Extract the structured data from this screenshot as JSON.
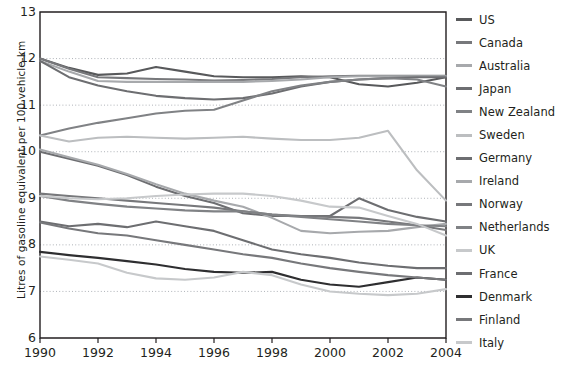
{
  "chart_data": {
    "type": "line",
    "title": "",
    "xlabel": "",
    "ylabel": "Litres of gasoline equivalent per 100 vehicle-km",
    "xlim": [
      1990,
      2004
    ],
    "ylim": [
      6,
      13
    ],
    "ytick_labels": [
      "13",
      "12",
      "11",
      "10",
      "9",
      "8",
      "7",
      "6"
    ],
    "ytick_values": [
      13,
      12,
      11,
      10,
      9,
      8,
      7,
      6
    ],
    "xtick_labels": [
      "1990",
      "1992",
      "1994",
      "1996",
      "1998",
      "2000",
      "2002",
      "2004"
    ],
    "xtick_values": [
      1990,
      1992,
      1994,
      1996,
      1998,
      2000,
      2002,
      2004
    ],
    "x": [
      1990,
      1991,
      1992,
      1993,
      1994,
      1995,
      1996,
      1997,
      1998,
      1999,
      2000,
      2001,
      2002,
      2003,
      2004
    ],
    "grid": "horizontal-dotted",
    "legend_position": "right",
    "series": [
      {
        "name": "US",
        "color": "#58595b",
        "values": [
          12.0,
          11.8,
          11.65,
          11.68,
          11.82,
          11.72,
          11.62,
          11.6,
          11.6,
          11.62,
          11.6,
          11.45,
          11.4,
          11.48,
          11.6
        ]
      },
      {
        "name": "Canada",
        "color": "#77787b",
        "values": [
          12.0,
          11.78,
          11.6,
          11.58,
          11.56,
          11.55,
          11.53,
          11.54,
          11.56,
          11.6,
          11.62,
          11.63,
          11.63,
          11.63,
          11.63
        ]
      },
      {
        "name": "Australia",
        "color": "#a7a9ac",
        "values": [
          11.95,
          11.72,
          11.52,
          11.5,
          11.5,
          11.5,
          11.5,
          11.5,
          11.52,
          11.55,
          11.6,
          11.62,
          11.62,
          11.62,
          11.62
        ]
      },
      {
        "name": "Japan",
        "color": "#6d6e71",
        "values": [
          11.95,
          11.6,
          11.42,
          11.3,
          11.2,
          11.15,
          11.12,
          11.15,
          11.25,
          11.4,
          11.5,
          11.55,
          11.58,
          11.6,
          11.6
        ]
      },
      {
        "name": "New Zealand",
        "color": "#808285",
        "values": [
          10.35,
          10.5,
          10.62,
          10.72,
          10.82,
          10.88,
          10.9,
          11.1,
          11.3,
          11.42,
          11.5,
          11.55,
          11.58,
          11.55,
          11.4
        ]
      },
      {
        "name": "Sweden",
        "color": "#bcbec0",
        "values": [
          10.35,
          10.22,
          10.3,
          10.32,
          10.3,
          10.28,
          10.3,
          10.32,
          10.28,
          10.25,
          10.25,
          10.3,
          10.45,
          9.6,
          8.95
        ]
      },
      {
        "name": "Germany",
        "color": "#6d6e71",
        "values": [
          10.0,
          9.85,
          9.7,
          9.5,
          9.25,
          9.05,
          8.9,
          8.68,
          8.62,
          8.62,
          8.62,
          9.0,
          8.75,
          8.6,
          8.5
        ]
      },
      {
        "name": "Ireland",
        "color": "#a7a9ac",
        "values": [
          10.05,
          9.88,
          9.72,
          9.52,
          9.3,
          9.1,
          8.95,
          8.82,
          8.58,
          8.3,
          8.25,
          8.28,
          8.3,
          8.38,
          8.45
        ]
      },
      {
        "name": "Norway",
        "color": "#77787b",
        "values": [
          9.1,
          9.05,
          9.0,
          8.95,
          8.9,
          8.85,
          8.8,
          8.72,
          8.65,
          8.62,
          8.6,
          8.58,
          8.5,
          8.42,
          8.32
        ]
      },
      {
        "name": "Netherlands",
        "color": "#808285",
        "values": [
          9.05,
          8.95,
          8.88,
          8.82,
          8.78,
          8.74,
          8.72,
          8.72,
          8.65,
          8.6,
          8.55,
          8.5,
          8.45,
          8.42,
          8.4
        ]
      },
      {
        "name": "UK",
        "color": "#c7c9cb",
        "values": [
          9.05,
          9.0,
          8.98,
          9.0,
          9.05,
          9.08,
          9.1,
          9.1,
          9.05,
          8.95,
          8.82,
          8.8,
          8.62,
          8.45,
          8.2
        ]
      },
      {
        "name": "France",
        "color": "#6d6e71",
        "values": [
          8.5,
          8.4,
          8.45,
          8.38,
          8.5,
          8.4,
          8.3,
          8.1,
          7.9,
          7.8,
          7.72,
          7.62,
          7.55,
          7.5,
          7.5
        ]
      },
      {
        "name": "Denmark",
        "color": "#2e2e30",
        "values": [
          7.85,
          7.78,
          7.72,
          7.65,
          7.58,
          7.48,
          7.42,
          7.4,
          7.42,
          7.25,
          7.15,
          7.1,
          7.2,
          7.3,
          7.25
        ]
      },
      {
        "name": "Finland",
        "color": "#77787b",
        "values": [
          8.48,
          8.35,
          8.25,
          8.2,
          8.1,
          8.0,
          7.9,
          7.8,
          7.72,
          7.6,
          7.5,
          7.42,
          7.35,
          7.3,
          7.25
        ]
      },
      {
        "name": "Italy",
        "color": "#c7c9cb",
        "values": [
          7.75,
          7.68,
          7.6,
          7.4,
          7.28,
          7.25,
          7.3,
          7.42,
          7.35,
          7.15,
          7.0,
          6.95,
          6.92,
          6.95,
          7.05
        ]
      }
    ]
  },
  "legend": {
    "items": [
      {
        "label": "US",
        "color": "#58595b"
      },
      {
        "label": "Canada",
        "color": "#77787b"
      },
      {
        "label": "Australia",
        "color": "#a7a9ac"
      },
      {
        "label": "Japan",
        "color": "#6d6e71"
      },
      {
        "label": "New Zealand",
        "color": "#808285"
      },
      {
        "label": "Sweden",
        "color": "#bcbec0"
      },
      {
        "label": "Germany",
        "color": "#6d6e71"
      },
      {
        "label": "Ireland",
        "color": "#a7a9ac"
      },
      {
        "label": "Norway",
        "color": "#77787b"
      },
      {
        "label": "Netherlands",
        "color": "#808285"
      },
      {
        "label": "UK",
        "color": "#c7c9cb"
      },
      {
        "label": "France",
        "color": "#6d6e71"
      },
      {
        "label": "Denmark",
        "color": "#2e2e30"
      },
      {
        "label": "Finland",
        "color": "#77787b"
      },
      {
        "label": "Italy",
        "color": "#c7c9cb"
      }
    ]
  },
  "axes": {
    "axis_color": "#231f20",
    "grid_color": "#9aa0a6"
  }
}
